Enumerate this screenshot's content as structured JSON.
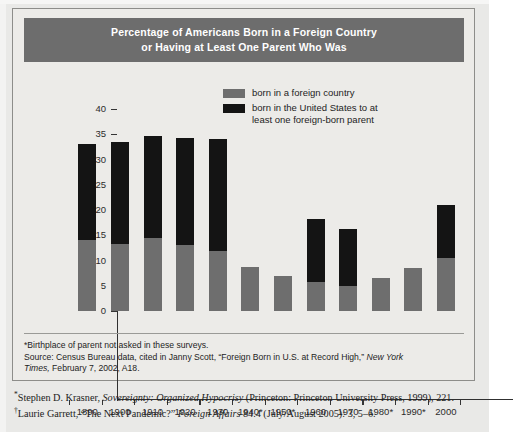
{
  "figure": {
    "title_line1": "Percentage of Americans Born in a Foreign Country",
    "title_line2": "or Having at Least One Parent Who Was",
    "title_banner_color": "#6d6d6d",
    "background_color": "#ecebe8"
  },
  "legend": {
    "position": "top-right",
    "items": [
      {
        "swatch": "gray-swatch-icon",
        "color": "#6e6e6e",
        "label": "born in a foreign country"
      },
      {
        "swatch": "black-swatch-icon",
        "color": "#141414",
        "label": "born in the United States to at least one foreign-born parent"
      }
    ],
    "item2_line1": "born in the United States to at",
    "item2_line2": "least one foreign-born parent"
  },
  "chart_data": {
    "type": "bar",
    "subtype": "stacked",
    "title": "Percentage of Americans Born in a Foreign Country or Having at Least One Parent Who Was",
    "xlabel": "",
    "ylabel": "Percentage",
    "ylim": [
      0,
      40
    ],
    "yticks": [
      0,
      5,
      10,
      15,
      20,
      25,
      30,
      35,
      40
    ],
    "ytick_labels": [
      "0",
      "5",
      "10",
      "15",
      "20",
      "25",
      "30",
      "35",
      "40"
    ],
    "grid": false,
    "categories": [
      "1890",
      "1900",
      "1910",
      "1920",
      "1930",
      "1940*",
      "1950*",
      "1960",
      "1970",
      "1980*",
      "1990*",
      "2000"
    ],
    "series": [
      {
        "name": "born in a foreign country",
        "color": "#6e6e6e",
        "values": [
          14.0,
          13.3,
          14.5,
          13.0,
          11.8,
          8.8,
          6.9,
          5.8,
          5.0,
          6.5,
          8.5,
          10.5
        ]
      },
      {
        "name": "born in the United States to at least one foreign-born parent",
        "color": "#141414",
        "values": [
          19.0,
          20.2,
          20.1,
          21.2,
          22.2,
          0,
          0,
          12.5,
          11.3,
          0,
          0,
          10.5
        ]
      }
    ],
    "totals": [
      33.0,
      33.5,
      34.6,
      34.2,
      34.0,
      8.8,
      6.9,
      18.3,
      16.3,
      6.5,
      8.5,
      21.0
    ],
    "annotations": [
      "*Birthplace of parent not asked in these surveys."
    ]
  },
  "source": {
    "note": "*Birthplace of parent not asked in these surveys.",
    "line1_plain": "Source: Census Bureau data, cited in Janny Scott, “Foreign Born in U.S. at Record High,” ",
    "line1_italic": "New York",
    "line2_italic": "Times,",
    "line2_plain": " February 7, 2002, A18."
  },
  "footnotes": [
    {
      "marker": "*",
      "text_before_italic": "Stephen D. Krasner, ",
      "italic_text": "Sovereignty: Organized Hypocrisy",
      "text_after_italic": " (Princeton: Princeton University Press, 1999), 221."
    },
    {
      "marker": "†",
      "text_before_italic": "Laurie Garrett, “The Next Pandemic?” ",
      "italic_text": "Foreign Affairs",
      "text_after_italic": " 84.4 (July/August 2005): 3, 5–6."
    }
  ]
}
